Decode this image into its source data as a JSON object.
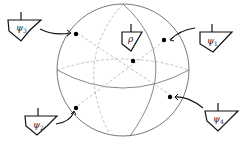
{
  "diagram": {
    "type": "bloch-sphere",
    "center_state": {
      "symbol": "ρ",
      "label": "rho"
    },
    "states": [
      {
        "id": "psi1",
        "symbol": "ψ",
        "subscript": "1"
      },
      {
        "id": "psi2",
        "symbol": "ψ",
        "subscript": "2"
      },
      {
        "id": "psi3",
        "symbol": "ψ",
        "subscript": "3"
      },
      {
        "id": "psi4",
        "symbol": "ψ",
        "subscript": "4"
      }
    ],
    "colors": {
      "stroke": "#333333",
      "dashed": "#aaaaaa",
      "point": "#000000"
    }
  }
}
